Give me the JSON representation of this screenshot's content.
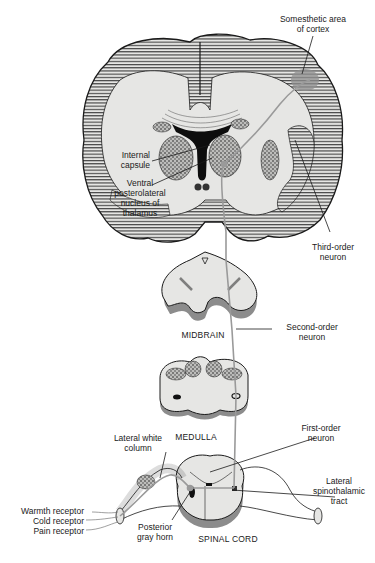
{
  "diagram": {
    "colors": {
      "background": "#ffffff",
      "tissue": "#e6e6e4",
      "outline": "#1a1a1a",
      "hatch": "#2a2a2a",
      "pathway": "#9a9a9a",
      "shadow": "#8c8c8c"
    },
    "labels": {
      "somesthetic": "Somesthetic area\nof cortex",
      "internal_capsule": "Internal\ncapsule",
      "vpl": "Ventral\nposterolateral\nnucleus of\nthalamus",
      "third_order": "Third-order\nneuron",
      "midbrain": "MIDBRAIN",
      "second_order": "Second-order\nneuron",
      "medulla": "MEDULLA",
      "first_order": "First-order\nneuron",
      "lateral_white_column": "Lateral white\ncolumn",
      "lateral_spinothalamic": "Lateral\nspinothalamic\ntract",
      "warmth": "Warmth receptor",
      "cold": "Cold receptor",
      "pain": "Pain receptor",
      "posterior_gray_horn": "Posterior\ngray horn",
      "spinal_cord": "SPINAL CORD"
    },
    "structures": [
      "cerebral cortex (coronal section)",
      "thalamus",
      "midbrain",
      "medulla",
      "spinal cord"
    ]
  }
}
